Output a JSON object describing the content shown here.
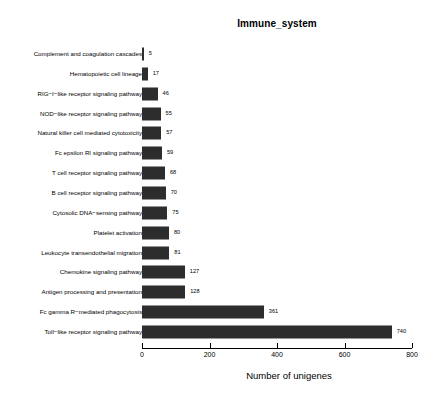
{
  "chart_data": {
    "type": "bar",
    "orientation": "horizontal",
    "title": "Immune_system",
    "xlabel": "Number of unigenes",
    "ylabel": "",
    "xlim": [
      0,
      800
    ],
    "xticks": [
      0,
      200,
      400,
      600,
      800
    ],
    "xtick_labels": [
      "0",
      "200",
      "400",
      "600",
      "800"
    ],
    "grid": false,
    "legend": null,
    "bar_color": "#2d2d2d",
    "categories": [
      "Complement and coagulation cascades",
      "Hematopoietic cell lineage",
      "RIG−I−like receptor signaling pathway",
      "NOD−like receptor signaling pathway",
      "Natural killer cell mediated cytotoxicity",
      "Fc epsilon RI signaling pathway",
      "T cell receptor signaling pathway",
      "B cell receptor signaling pathway",
      "Cytosolic DNA−sensing pathway",
      "Platelet activation",
      "Leukocyte transendothelial migration",
      "Chemokine signaling pathway",
      "Antigen processing and presentation",
      "Fc gamma R−mediated phagocytosis",
      "Toll−like receptor signaling pathway"
    ],
    "values": [
      5,
      17,
      46,
      55,
      57,
      59,
      68,
      70,
      75,
      80,
      81,
      127,
      128,
      361,
      740
    ],
    "value_labels": [
      "5",
      "17",
      "46",
      "55",
      "57",
      "59",
      "68",
      "70",
      "75",
      "80",
      "81",
      "127",
      "128",
      "361",
      "740"
    ]
  }
}
